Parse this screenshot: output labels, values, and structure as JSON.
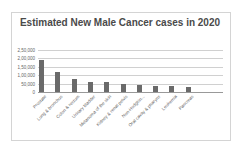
{
  "chart_data": {
    "type": "bar",
    "title": "Estimated New Male Cancer cases in 2020",
    "categories": [
      "Prostate",
      "Lung & bronchus",
      "Colon & rectum",
      "Urinary bladder",
      "Melanoma of the skin",
      "Kidney & renal pelvis",
      "Non-Hodgkin...",
      "Oral cavity & pharynx",
      "Leukemia",
      "Pancreas"
    ],
    "values": [
      191930,
      116300,
      78300,
      62100,
      60190,
      45520,
      42380,
      38380,
      35470,
      30400
    ],
    "xlabel": "",
    "ylabel": "",
    "ylim": [
      0,
      250000
    ],
    "yticks": [
      "2,50,000",
      "2,00,000",
      "1,50,000",
      "1,00,000",
      "50,000",
      "0"
    ],
    "grid": true,
    "legend": "none",
    "bar_color": "#6a6a6a"
  }
}
